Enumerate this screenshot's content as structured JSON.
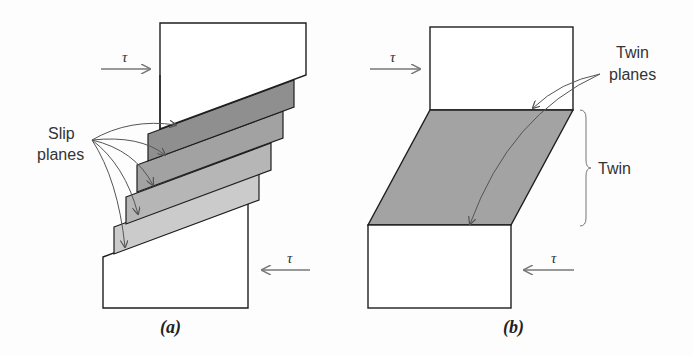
{
  "panel_a": {
    "caption": "(a)",
    "label_line1": "Slip",
    "label_line2": "planes",
    "tau_top": "τ",
    "tau_bottom": "τ",
    "layer_colors": [
      "#8f8f8f",
      "#a2a2a2",
      "#b6b6b6",
      "#cbcbcb"
    ]
  },
  "panel_b": {
    "caption": "(b)",
    "twin_planes_line1": "Twin",
    "twin_planes_line2": "planes",
    "twin_label": "Twin",
    "tau_top": "τ",
    "tau_bottom": "τ",
    "twin_color": "#a3a3a3"
  },
  "colors": {
    "outline": "#1e1e1e",
    "arrow": "#777777"
  }
}
